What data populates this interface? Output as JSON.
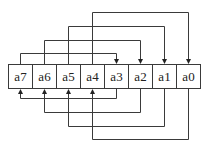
{
  "diagram": {
    "title": "",
    "register": {
      "cells": [
        {
          "id": "a7",
          "label": "a7"
        },
        {
          "id": "a6",
          "label": "a6"
        },
        {
          "id": "a5",
          "label": "a5"
        },
        {
          "id": "a4",
          "label": "a4"
        },
        {
          "id": "a3",
          "label": "a3"
        },
        {
          "id": "a2",
          "label": "a2"
        },
        {
          "id": "a1",
          "label": "a1"
        },
        {
          "id": "a0",
          "label": "a0"
        }
      ]
    },
    "top_connections": [
      {
        "from": "a4",
        "to": "a0",
        "level": 1
      },
      {
        "from": "a5",
        "to": "a1",
        "level": 2
      },
      {
        "from": "a6",
        "to": "a2",
        "level": 3
      },
      {
        "from": "a7",
        "to": "a3",
        "level": 4
      }
    ],
    "bottom_connections": [
      {
        "from": "a3",
        "to": "a7",
        "level": 1
      },
      {
        "from": "a2",
        "to": "a6",
        "level": 2
      },
      {
        "from": "a1",
        "to": "a5",
        "level": 3
      },
      {
        "from": "a0",
        "to": "a4",
        "level": 4
      }
    ],
    "colors": {
      "line": "#3a3a3a",
      "text": "#222222",
      "background": "#ffffff"
    }
  }
}
